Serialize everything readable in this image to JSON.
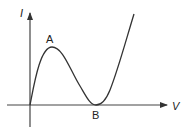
{
  "diagram": {
    "type": "I-V characteristic curve",
    "axes": {
      "y_label": "I",
      "x_label": "V"
    },
    "points": {
      "peak_label": "A",
      "valley_label": "B"
    },
    "colors": {
      "line": "#333333",
      "axis": "#444444",
      "background": "#ffffff"
    }
  }
}
